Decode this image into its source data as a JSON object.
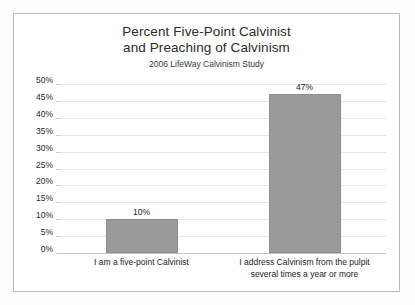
{
  "chart_data": {
    "type": "bar",
    "title": "Percent Five-Point Calvinist\nand Preaching of Calvinism",
    "title_line1": "Percent Five-Point Calvinist",
    "title_line2": "and Preaching of Calvinism",
    "subtitle": "2006 LifeWay Calvinism Study",
    "xlabel": "",
    "ylabel": "",
    "categories": [
      "I am a five-point Calvinist",
      "I address Calvinism from the pulpit several times a year or more"
    ],
    "category_lines": [
      [
        "I am a five-point Calvinist"
      ],
      [
        "I address Calvinism from the pulpit",
        "several times a year or more"
      ]
    ],
    "values": [
      10,
      47
    ],
    "data_labels": [
      "10%",
      "47%"
    ],
    "ylim": [
      0,
      50
    ],
    "ytick_step": 5,
    "ytick_labels": [
      "50%",
      "45%",
      "40%",
      "35%",
      "30%",
      "25%",
      "20%",
      "15%",
      "10%",
      "5%",
      "0%"
    ],
    "ytick_values": [
      50,
      45,
      40,
      35,
      30,
      25,
      20,
      15,
      10,
      5,
      0
    ],
    "grid": true,
    "legend": false,
    "legend_position": "none",
    "bar_color": "#9a9a9a",
    "gridline_color": "#e4e6e8",
    "axis_color": "#c2c5c8",
    "text_color": "#1f1f1f",
    "background_color": "#ffffff",
    "frame_color": "#b9bcc0"
  }
}
